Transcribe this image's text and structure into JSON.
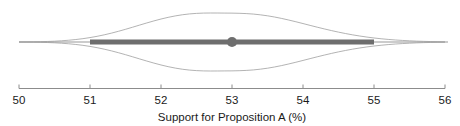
{
  "chart_data": {
    "type": "area",
    "title": "",
    "subtitle": "",
    "xlabel": "Support for Proposition A (%)",
    "ylabel": "",
    "xlim": [
      50,
      56
    ],
    "xticks": [
      50,
      51,
      52,
      53,
      54,
      55,
      56
    ],
    "xtick_labels": [
      "50",
      "51",
      "52",
      "53",
      "54",
      "55",
      "56"
    ],
    "grid": false,
    "legend": null,
    "chart_variant": "eye-plot-violin-with-interval",
    "point_estimate": 53,
    "inner_interval": [
      51,
      55
    ],
    "outer_interval": [
      50,
      56
    ],
    "density_peak_half_height_px": 29,
    "density": {
      "x": [
        50.0,
        50.1,
        50.2,
        50.3,
        50.4,
        50.5,
        50.6,
        50.7,
        50.8,
        50.9,
        51.0,
        51.1,
        51.2,
        51.3,
        51.4,
        51.5,
        51.6,
        51.7,
        51.8,
        51.9,
        52.0,
        52.1,
        52.2,
        52.3,
        52.4,
        52.5,
        52.6,
        52.7,
        52.8,
        52.9,
        53.0,
        53.1,
        53.2,
        53.3,
        53.4,
        53.5,
        53.6,
        53.7,
        53.8,
        53.9,
        54.0,
        54.1,
        54.2,
        54.3,
        54.4,
        54.5,
        54.6,
        54.7,
        54.8,
        54.9,
        55.0,
        55.1,
        55.2,
        55.3,
        55.4,
        55.5,
        55.6,
        55.7,
        55.8,
        55.9,
        56.0
      ],
      "y": [
        0.0,
        0.003,
        0.006,
        0.011,
        0.018,
        0.028,
        0.042,
        0.061,
        0.085,
        0.115,
        0.152,
        0.196,
        0.247,
        0.305,
        0.369,
        0.438,
        0.51,
        0.584,
        0.657,
        0.727,
        0.792,
        0.85,
        0.899,
        0.939,
        0.968,
        0.987,
        0.997,
        1.0,
        0.999,
        0.997,
        0.995,
        0.99,
        0.98,
        0.963,
        0.937,
        0.903,
        0.861,
        0.812,
        0.757,
        0.698,
        0.636,
        0.573,
        0.511,
        0.451,
        0.394,
        0.34,
        0.291,
        0.246,
        0.206,
        0.17,
        0.139,
        0.112,
        0.089,
        0.07,
        0.054,
        0.041,
        0.03,
        0.022,
        0.015,
        0.009,
        0.0
      ]
    }
  },
  "axis": {
    "title": "Support for Proposition A (%)",
    "tick_labels": [
      "50",
      "51",
      "52",
      "53",
      "54",
      "55",
      "56"
    ]
  },
  "colors": {
    "background": "#ffffff",
    "axis_line": "#8c8c8c",
    "density_outline": "#9a9a9a",
    "interval_bar": "#6e6e6e",
    "thin_line": "#9a9a9a",
    "point": "#6e6e6e",
    "text": "#1a1a1a"
  }
}
